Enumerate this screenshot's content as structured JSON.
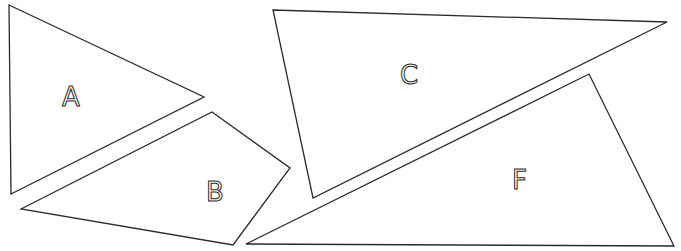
{
  "diagram": {
    "type": "polygon-pieces",
    "stroke_color": "#2a2a2a",
    "background": "#ffffff",
    "shapes": [
      {
        "id": "A",
        "label": "A",
        "kind": "triangle",
        "points": "9,5 204,97 11,194",
        "label_pos": [
          62,
          108
        ]
      },
      {
        "id": "B",
        "label": "B",
        "kind": "quadrilateral",
        "points": "21,209 212,112 290,168 233,245",
        "label_pos": [
          206,
          203
        ]
      },
      {
        "id": "C",
        "label": "C",
        "kind": "triangle",
        "points": "273,10 667,22 313,198",
        "label_pos": [
          400,
          85
        ]
      },
      {
        "id": "F",
        "label": "F",
        "kind": "triangle",
        "points": "246,244 589,74 674,246",
        "label_pos": [
          512,
          191
        ]
      }
    ]
  }
}
